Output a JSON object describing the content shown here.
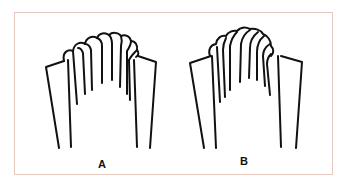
{
  "figure": {
    "border_color": "#e8c9bd",
    "line_color": "#111111",
    "panels": [
      {
        "id": "A",
        "label": "A"
      },
      {
        "id": "B",
        "label": "B"
      }
    ]
  }
}
